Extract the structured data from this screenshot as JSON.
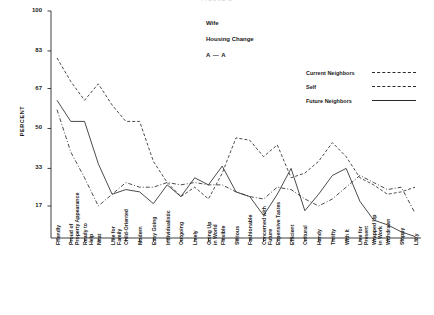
{
  "chart_title": "FIGURE 5",
  "annotations": {
    "group": "Wife",
    "condition": "Housing Change",
    "pairing": "A — A"
  },
  "axis": {
    "ylabel": "PERCENT",
    "yticks": [
      100,
      83,
      67,
      50,
      33,
      17
    ],
    "ylim": [
      0,
      100
    ]
  },
  "legend": {
    "position": "top-right",
    "entries": [
      {
        "label": "Current Neighbors",
        "style": "dash-dot"
      },
      {
        "label": "Self",
        "style": "dashed"
      },
      {
        "label": "Future Neighbors",
        "style": "solid"
      }
    ]
  },
  "chart_data": {
    "type": "line",
    "title": "FIGURE 5",
    "xlabel": "",
    "ylabel": "PERCENT",
    "ylim": [
      0,
      100
    ],
    "grid": false,
    "legend_position": "top-right",
    "categories": [
      "Friendly",
      "Proud of Property Appearance",
      "Ready to Help",
      "Neat",
      "Live for Family",
      "Child-Oriented",
      "Modern",
      "Easy Going",
      "Individualistic",
      "Outgoing",
      "Lively",
      "Going Up in World",
      "Flexible",
      "Serious",
      "Fashionable",
      "Concerned with Future",
      "Expensive Tastes",
      "Efficient",
      "Cultural",
      "Handy",
      "Thrifty",
      "With It",
      "Live for Present",
      "Wrapped Up in Work",
      "Withdrawn",
      "Sloppy",
      "Lazy"
    ],
    "series": [
      {
        "name": "Self",
        "style": "dashed",
        "values": [
          80,
          70,
          62,
          69,
          60,
          53,
          53,
          36,
          27,
          21,
          25,
          20,
          31,
          46,
          45,
          38,
          43,
          29,
          31,
          36,
          44,
          38,
          29,
          26,
          22,
          23,
          25
        ]
      },
      {
        "name": "Future Neighbors",
        "style": "solid",
        "values": [
          62,
          53,
          53,
          35,
          22,
          24,
          23,
          18,
          26,
          21,
          29,
          26,
          34,
          23,
          21,
          13,
          22,
          33,
          15,
          22,
          30,
          33,
          19,
          11,
          9,
          6,
          4
        ]
      },
      {
        "name": "Current Neighbors",
        "style": "dash-dot",
        "values": [
          58,
          40,
          29,
          17,
          22,
          27,
          25,
          25,
          27,
          26,
          27,
          26,
          26,
          23,
          21,
          20,
          25,
          24,
          20,
          17,
          20,
          25,
          30,
          27,
          24,
          25,
          14
        ]
      }
    ]
  }
}
